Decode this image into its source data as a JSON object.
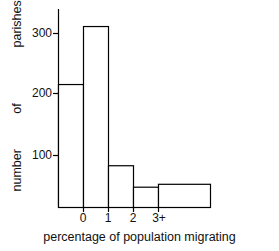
{
  "chart_data": {
    "type": "bar",
    "title": "",
    "subtitle": "",
    "xlabel": "percentage of population migrating",
    "ylabel": "number of parishes",
    "ylabel_words": [
      "parishes",
      "of",
      "number"
    ],
    "categories": [
      "<0",
      "0-1",
      "1-2",
      "2-3",
      "3+"
    ],
    "tick_labels_x": [
      "0",
      "1",
      "2",
      "3+"
    ],
    "tick_labels_y": [
      "100",
      "200",
      "300"
    ],
    "tick_values_y": [
      100,
      200,
      300
    ],
    "values": [
      212,
      312,
      72,
      35,
      40
    ],
    "xlim": [
      -1,
      4
    ],
    "ylim": [
      0,
      340
    ],
    "grid": false,
    "legend": false,
    "bar_fill": "#ffffff",
    "bar_edge": "#000000",
    "axis_color": "#000000",
    "background": "#ffffff"
  },
  "axes": {
    "x_tick_label_0": "0",
    "x_tick_label_1": "1",
    "x_tick_label_2": "2",
    "x_tick_label_3": "3+",
    "y_tick_label_100": "100",
    "y_tick_label_200": "200",
    "y_tick_label_300": "300"
  },
  "labels": {
    "y_axis_caption": "number of parishes",
    "y_word_top": "parishes",
    "y_word_mid": "of",
    "y_word_bottom": "number",
    "x_axis_caption": "percentage of population migrating"
  }
}
